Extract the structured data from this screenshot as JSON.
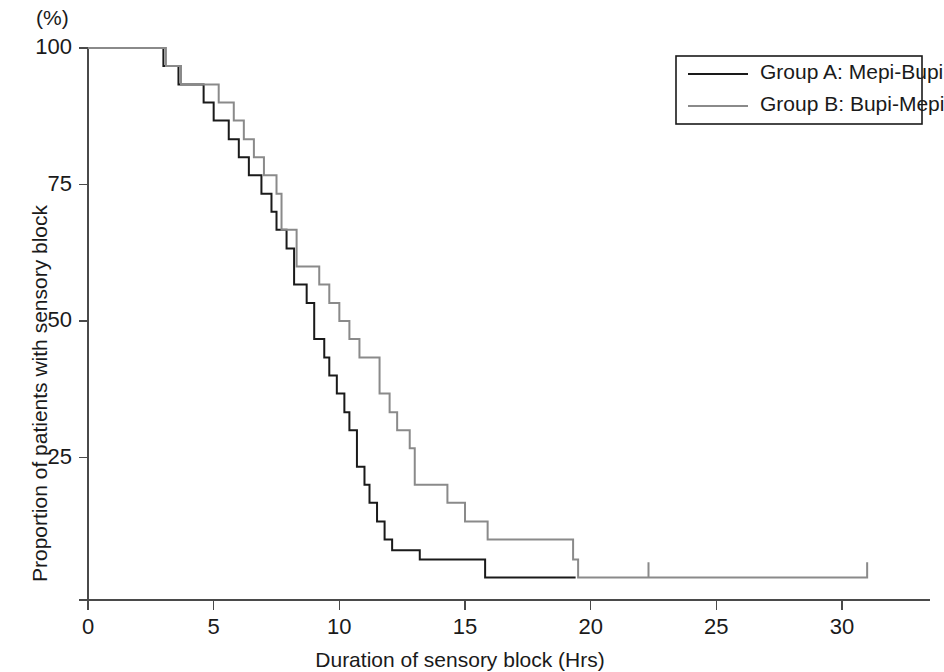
{
  "chart_data": {
    "type": "line",
    "subtype": "kaplan-meier-step",
    "title": "",
    "xlabel": "Duration of sensory block (Hrs)",
    "ylabel": "Proportion of patients with sensory  block",
    "yunit": "(%)",
    "xlim": [
      0,
      33.5
    ],
    "ylim": [
      0,
      103
    ],
    "xticks": [
      0,
      5,
      10,
      15,
      20,
      25,
      30
    ],
    "xtick_labels": [
      "0",
      "5",
      "10",
      "15",
      "20",
      "25",
      "30"
    ],
    "yticks": [
      25,
      50,
      75,
      100
    ],
    "ytick_labels": [
      "25",
      "50",
      "75",
      "100"
    ],
    "grid": false,
    "legend_position": "top-right",
    "series": [
      {
        "name": "Group A: Mepi-Bupi",
        "color": "#1a1a1a",
        "width": 2.0,
        "points": [
          [
            0.0,
            100
          ],
          [
            3.0,
            100
          ],
          [
            3.0,
            96.7
          ],
          [
            3.6,
            96.7
          ],
          [
            3.6,
            93.3
          ],
          [
            4.6,
            93.3
          ],
          [
            4.6,
            90.0
          ],
          [
            5.0,
            90.0
          ],
          [
            5.0,
            86.7
          ],
          [
            5.6,
            86.7
          ],
          [
            5.6,
            83.3
          ],
          [
            6.0,
            83.3
          ],
          [
            6.0,
            80.0
          ],
          [
            6.4,
            80.0
          ],
          [
            6.4,
            76.7
          ],
          [
            6.9,
            76.7
          ],
          [
            6.9,
            73.3
          ],
          [
            7.3,
            73.3
          ],
          [
            7.3,
            70.0
          ],
          [
            7.5,
            70.0
          ],
          [
            7.5,
            66.7
          ],
          [
            7.9,
            66.7
          ],
          [
            7.9,
            63.3
          ],
          [
            8.2,
            63.3
          ],
          [
            8.2,
            56.7
          ],
          [
            8.7,
            56.7
          ],
          [
            8.7,
            53.3
          ],
          [
            9.0,
            53.3
          ],
          [
            9.0,
            46.7
          ],
          [
            9.4,
            46.7
          ],
          [
            9.4,
            43.3
          ],
          [
            9.6,
            43.3
          ],
          [
            9.6,
            40.0
          ],
          [
            9.9,
            40.0
          ],
          [
            9.9,
            36.7
          ],
          [
            10.2,
            36.7
          ],
          [
            10.2,
            33.3
          ],
          [
            10.4,
            33.3
          ],
          [
            10.4,
            30.0
          ],
          [
            10.7,
            30.0
          ],
          [
            10.7,
            23.3
          ],
          [
            11.0,
            23.3
          ],
          [
            11.0,
            20.0
          ],
          [
            11.2,
            20.0
          ],
          [
            11.2,
            16.7
          ],
          [
            11.5,
            16.7
          ],
          [
            11.5,
            13.3
          ],
          [
            11.8,
            13.3
          ],
          [
            11.8,
            10.0
          ],
          [
            12.1,
            10.0
          ],
          [
            12.1,
            8.0
          ],
          [
            13.2,
            8.0
          ],
          [
            13.2,
            6.3
          ],
          [
            15.8,
            6.3
          ],
          [
            15.8,
            3.0
          ],
          [
            19.4,
            3.0
          ]
        ]
      },
      {
        "name": "Group B: Bupi-Mepi",
        "color": "#8a8a8a",
        "width": 2.0,
        "points": [
          [
            0.0,
            100
          ],
          [
            3.1,
            100
          ],
          [
            3.1,
            96.7
          ],
          [
            3.7,
            96.7
          ],
          [
            3.7,
            93.3
          ],
          [
            5.2,
            93.3
          ],
          [
            5.2,
            90.0
          ],
          [
            5.8,
            90.0
          ],
          [
            5.8,
            86.7
          ],
          [
            6.2,
            86.7
          ],
          [
            6.2,
            83.3
          ],
          [
            6.6,
            83.3
          ],
          [
            6.6,
            80.0
          ],
          [
            7.0,
            80.0
          ],
          [
            7.0,
            76.7
          ],
          [
            7.5,
            76.7
          ],
          [
            7.5,
            73.3
          ],
          [
            7.7,
            73.3
          ],
          [
            7.7,
            66.7
          ],
          [
            8.3,
            66.7
          ],
          [
            8.3,
            60.0
          ],
          [
            9.2,
            60.0
          ],
          [
            9.2,
            56.7
          ],
          [
            9.6,
            56.7
          ],
          [
            9.6,
            53.3
          ],
          [
            10.0,
            53.3
          ],
          [
            10.0,
            50.0
          ],
          [
            10.4,
            50.0
          ],
          [
            10.4,
            46.7
          ],
          [
            10.8,
            46.7
          ],
          [
            10.8,
            43.3
          ],
          [
            11.6,
            43.3
          ],
          [
            11.6,
            36.7
          ],
          [
            12.0,
            36.7
          ],
          [
            12.0,
            33.3
          ],
          [
            12.3,
            33.3
          ],
          [
            12.3,
            30.0
          ],
          [
            12.8,
            30.0
          ],
          [
            12.8,
            26.7
          ],
          [
            13.0,
            26.7
          ],
          [
            13.0,
            20.0
          ],
          [
            14.3,
            20.0
          ],
          [
            14.3,
            16.7
          ],
          [
            15.0,
            16.7
          ],
          [
            15.0,
            13.3
          ],
          [
            15.9,
            13.3
          ],
          [
            15.9,
            10.0
          ],
          [
            19.3,
            10.0
          ],
          [
            19.3,
            6.3
          ],
          [
            19.5,
            6.3
          ],
          [
            19.5,
            3.0
          ],
          [
            22.3,
            3.0
          ],
          [
            22.3,
            5.8
          ],
          [
            22.3,
            3.0
          ],
          [
            31.0,
            3.0
          ],
          [
            31.0,
            5.8
          ]
        ]
      }
    ],
    "legend": [
      {
        "label": "Group A: Mepi-Bupi",
        "color": "#1a1a1a"
      },
      {
        "label": "Group B: Bupi-Mepi",
        "color": "#8a8a8a"
      }
    ],
    "axis_color": "#4a4a4a"
  }
}
